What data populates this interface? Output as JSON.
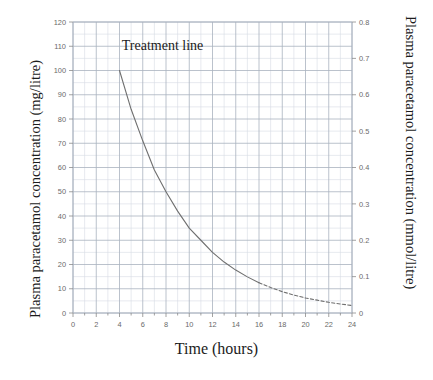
{
  "figure": {
    "x_axis_title": "Time (hours)",
    "left_axis_title": "Plasma paracetamol concentration (mg/litre)",
    "right_axis_title": "Plasma paracetamol concentration (mmol/litre)",
    "annotation": "Treatment line"
  },
  "chart_data": {
    "type": "line",
    "title": "",
    "subtitle": "",
    "xlabel": "Time (hours)",
    "ylabel": "Plasma paracetamol concentration (mg/litre)",
    "y2label": "Plasma paracetamol concentration (mmol/litre)",
    "xlim": [
      0,
      24
    ],
    "ylim": [
      0,
      120
    ],
    "y2lim": [
      0,
      0.8
    ],
    "grid": true,
    "legend": "none",
    "x_major_ticks": [
      0,
      2,
      4,
      6,
      8,
      10,
      12,
      14,
      16,
      18,
      20,
      22,
      24
    ],
    "x_minor_step": 1,
    "y_major_ticks": [
      0,
      10,
      20,
      30,
      40,
      50,
      60,
      70,
      80,
      90,
      100,
      110,
      120
    ],
    "y2_major_ticks": [
      0,
      0.1,
      0.2,
      0.3,
      0.4,
      0.5,
      0.6,
      0.7,
      0.8
    ],
    "annotations": [
      {
        "text": "Treatment line",
        "x": 4.2,
        "y": 110
      }
    ],
    "series": [
      {
        "name": "Treatment line",
        "color": "#6f6f6f",
        "style": "solid-then-dashed",
        "dash_starts_at_x": 16,
        "x": [
          4,
          5,
          6,
          7,
          8,
          9,
          10,
          11,
          12,
          13,
          14,
          15,
          16,
          17,
          18,
          19,
          20,
          21,
          22,
          23,
          24
        ],
        "y": [
          100,
          84,
          71,
          59,
          50,
          42,
          35,
          30,
          25,
          21,
          17.7,
          14.9,
          12.5,
          10.5,
          8.8,
          7.4,
          6.2,
          5.3,
          4.4,
          3.7,
          3.1
        ]
      }
    ]
  }
}
